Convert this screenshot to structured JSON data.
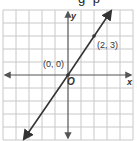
{
  "header_fragment": "g p",
  "graph": {
    "x_axis_label": "x",
    "y_axis_label": "y",
    "origin_label": "O",
    "grid": {
      "columns": 10,
      "rows": 10,
      "cell_px": 13
    },
    "points": [
      {
        "label": "(0, 0)",
        "x": 0,
        "y": 0
      },
      {
        "label": "(2, 3)",
        "x": 2,
        "y": 3
      }
    ],
    "line": {
      "slope": 1.5,
      "intercept": 0,
      "equation": "y = 3/2 x"
    },
    "colors": {
      "grid": "#c8c8c8",
      "axis": "#555555",
      "line": "#333333"
    }
  }
}
